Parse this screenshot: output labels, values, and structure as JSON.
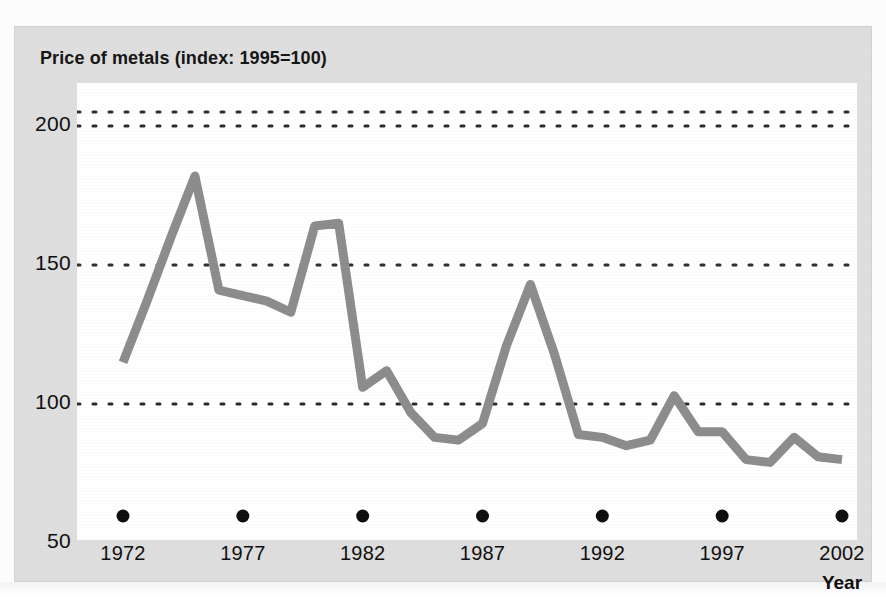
{
  "figure": {
    "title": "Price of metals (index: 1995=100)",
    "background_color": "#dedede",
    "plot_background_color": "#ffffff",
    "line_color": "#8c8c8c",
    "text_color": "#0d0d0d"
  },
  "axes": {
    "y": {
      "ticks": [
        "200",
        "150",
        "100",
        "50"
      ],
      "values": [
        200,
        150,
        100,
        50
      ]
    },
    "x": {
      "title": "Year",
      "ticks": [
        "1972",
        "1977",
        "1982",
        "1987",
        "1992",
        "1997",
        "2002"
      ],
      "values": [
        1972,
        1977,
        1982,
        1987,
        1992,
        1997,
        2002
      ]
    }
  },
  "chart_data": {
    "type": "line",
    "title": "Price of metals (index: 1995=100)",
    "xlabel": "Year",
    "ylabel": "",
    "xlim": [
      1972,
      2002
    ],
    "ylim": [
      50,
      205
    ],
    "grid": "horizontal-dotted",
    "legend": "none",
    "x": [
      1972,
      1973,
      1974,
      1975,
      1976,
      1977,
      1978,
      1979,
      1980,
      1981,
      1982,
      1983,
      1984,
      1985,
      1986,
      1987,
      1988,
      1989,
      1990,
      1991,
      1992,
      1993,
      1994,
      1995,
      1996,
      1997,
      1998,
      1999,
      2000,
      2001,
      2002
    ],
    "values": [
      115,
      137,
      160,
      182,
      141,
      139,
      137,
      133,
      164,
      165,
      106,
      112,
      97,
      88,
      87,
      93,
      121,
      143,
      118,
      89,
      88,
      85,
      87,
      103,
      90,
      90,
      80,
      79,
      88,
      81,
      80
    ],
    "series": [
      {
        "name": "Price of metals index",
        "color": "#8c8c8c",
        "values": [
          115,
          137,
          160,
          182,
          141,
          139,
          137,
          133,
          164,
          165,
          106,
          112,
          97,
          88,
          87,
          93,
          121,
          143,
          118,
          89,
          88,
          85,
          87,
          103,
          90,
          90,
          80,
          79,
          88,
          81,
          80
        ]
      }
    ],
    "x_tick_labels": [
      "1972",
      "1977",
      "1982",
      "1987",
      "1992",
      "1997",
      "2002"
    ],
    "y_tick_labels": [
      "50",
      "100",
      "150",
      "200"
    ],
    "gridline_values": [
      100,
      150,
      200,
      205
    ]
  }
}
